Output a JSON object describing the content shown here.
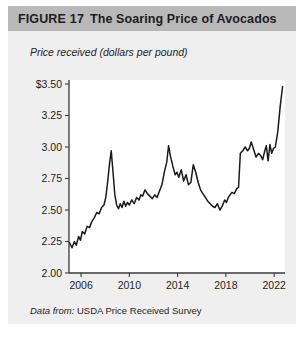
{
  "figure": {
    "label": "FIGURE",
    "number": "17",
    "title": "The Soaring Price of Avocados",
    "source_lead": "Data from:",
    "source_text": "USDA Price Received Survey"
  },
  "colors": {
    "header_bar": "#b9b9b9",
    "card_background": "#efefef",
    "plot_background": "#ffffff",
    "line": "#1a1a1a",
    "axis": "#3a3a3a",
    "text": "#1d1d1d"
  },
  "chart_data": {
    "type": "line",
    "title": "The Soaring Price of Avocados",
    "xlabel": "",
    "ylabel": "Price received (dollars per pound)",
    "xlim": [
      2005.0,
      2022.9
    ],
    "ylim": [
      2.0,
      3.5
    ],
    "grid": false,
    "legend": null,
    "y_ticks": [
      2.0,
      2.25,
      2.5,
      2.75,
      3.0,
      3.25,
      3.5
    ],
    "y_tick_labels": [
      "2.00",
      "2.25",
      "2.50",
      "2.75",
      "3.00",
      "3.25",
      "$3.50"
    ],
    "x_ticks": [
      2006,
      2010,
      2014,
      2018,
      2022
    ],
    "x_tick_labels": [
      "2006",
      "2010",
      "2014",
      "2018",
      "2022"
    ],
    "series": [
      {
        "name": "Price received (dollars per pound)",
        "x": [
          2005.05,
          2005.25,
          2005.45,
          2005.6,
          2005.8,
          2005.95,
          2006.1,
          2006.3,
          2006.5,
          2006.7,
          2006.9,
          2007.1,
          2007.3,
          2007.5,
          2007.7,
          2007.9,
          2008.05,
          2008.2,
          2008.35,
          2008.5,
          2008.65,
          2008.8,
          2008.95,
          2009.1,
          2009.25,
          2009.4,
          2009.55,
          2009.7,
          2009.85,
          2010.0,
          2010.2,
          2010.4,
          2010.6,
          2010.8,
          2010.95,
          2011.1,
          2011.3,
          2011.5,
          2011.7,
          2011.9,
          2012.1,
          2012.3,
          2012.5,
          2012.7,
          2012.9,
          2013.1,
          2013.25,
          2013.4,
          2013.6,
          2013.8,
          2013.95,
          2014.1,
          2014.3,
          2014.5,
          2014.7,
          2014.9,
          2015.1,
          2015.3,
          2015.5,
          2015.7,
          2015.9,
          2016.1,
          2016.3,
          2016.5,
          2016.7,
          2016.9,
          2017.1,
          2017.3,
          2017.5,
          2017.7,
          2017.9,
          2018.05,
          2018.2,
          2018.35,
          2018.5,
          2018.7,
          2018.9,
          2019.05,
          2019.2,
          2019.4,
          2019.6,
          2019.8,
          2019.95,
          2020.1,
          2020.3,
          2020.5,
          2020.7,
          2020.9,
          2021.05,
          2021.2,
          2021.35,
          2021.5,
          2021.65,
          2021.8,
          2021.95,
          2022.1,
          2022.3,
          2022.5,
          2022.7
        ],
        "y": [
          2.24,
          2.2,
          2.25,
          2.22,
          2.29,
          2.26,
          2.33,
          2.31,
          2.37,
          2.36,
          2.41,
          2.44,
          2.48,
          2.47,
          2.52,
          2.54,
          2.6,
          2.72,
          2.86,
          2.97,
          2.8,
          2.62,
          2.54,
          2.51,
          2.55,
          2.52,
          2.57,
          2.53,
          2.56,
          2.54,
          2.58,
          2.55,
          2.6,
          2.58,
          2.62,
          2.61,
          2.66,
          2.63,
          2.61,
          2.59,
          2.62,
          2.6,
          2.65,
          2.7,
          2.8,
          2.88,
          3.01,
          2.93,
          2.85,
          2.78,
          2.8,
          2.76,
          2.82,
          2.73,
          2.78,
          2.7,
          2.72,
          2.86,
          2.8,
          2.72,
          2.66,
          2.63,
          2.6,
          2.57,
          2.55,
          2.53,
          2.52,
          2.55,
          2.5,
          2.53,
          2.58,
          2.56,
          2.6,
          2.62,
          2.64,
          2.63,
          2.67,
          2.68,
          2.95,
          2.97,
          3.0,
          2.97,
          2.99,
          3.04,
          2.98,
          2.92,
          2.95,
          2.93,
          2.9,
          2.96,
          3.01,
          2.89,
          3.02,
          2.95,
          2.99,
          3.0,
          3.12,
          3.32,
          3.48
        ]
      }
    ]
  }
}
